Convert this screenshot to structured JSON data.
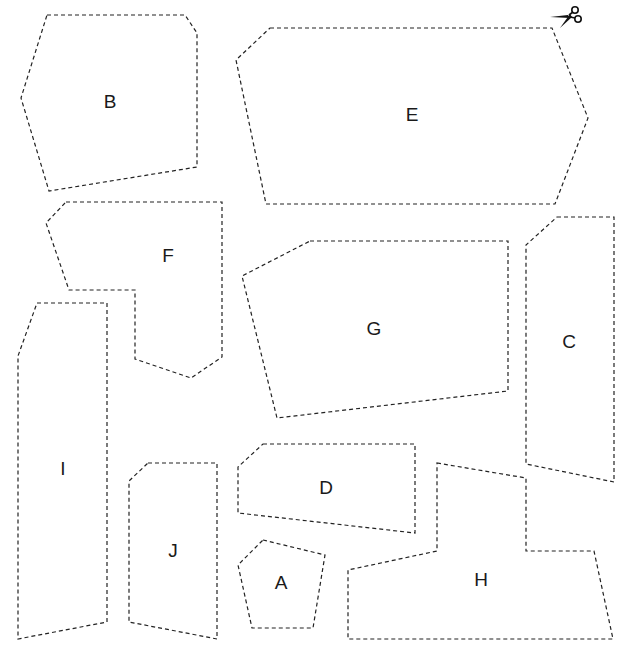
{
  "page": {
    "width": 629,
    "height": 657,
    "line_color": "#222222",
    "background": "#ffffff"
  },
  "scissors": {
    "icon": "scissors-icon",
    "position": [
      565,
      18
    ]
  },
  "pieces": [
    {
      "id": "A",
      "label": "A",
      "label_pos": [
        281,
        584
      ],
      "points": [
        [
          263,
          540
        ],
        [
          325,
          555
        ],
        [
          313,
          628
        ],
        [
          252,
          628
        ],
        [
          238,
          565
        ]
      ]
    },
    {
      "id": "B",
      "label": "B",
      "label_pos": [
        110,
        103
      ],
      "points": [
        [
          47,
          15
        ],
        [
          185,
          15
        ],
        [
          197,
          33
        ],
        [
          197,
          167
        ],
        [
          49,
          191
        ],
        [
          21,
          98
        ]
      ]
    },
    {
      "id": "C",
      "label": "C",
      "label_pos": [
        569,
        343
      ],
      "points": [
        [
          557,
          217
        ],
        [
          614,
          217
        ],
        [
          614,
          482
        ],
        [
          526,
          464
        ],
        [
          526,
          245
        ]
      ]
    },
    {
      "id": "D",
      "label": "D",
      "label_pos": [
        326,
        489
      ],
      "points": [
        [
          263,
          444
        ],
        [
          415,
          444
        ],
        [
          415,
          533
        ],
        [
          238,
          513
        ],
        [
          238,
          467
        ]
      ]
    },
    {
      "id": "E",
      "label": "E",
      "label_pos": [
        412,
        116
      ],
      "points": [
        [
          270,
          28
        ],
        [
          552,
          28
        ],
        [
          588,
          118
        ],
        [
          555,
          204
        ],
        [
          266,
          204
        ],
        [
          236,
          60
        ]
      ]
    },
    {
      "id": "F",
      "label": "F",
      "label_pos": [
        168,
        257
      ],
      "points": [
        [
          66,
          202
        ],
        [
          222,
          202
        ],
        [
          222,
          357
        ],
        [
          191,
          378
        ],
        [
          135,
          359
        ],
        [
          135,
          290
        ],
        [
          69,
          290
        ],
        [
          46,
          223
        ]
      ]
    },
    {
      "id": "G",
      "label": "G",
      "label_pos": [
        374,
        330
      ],
      "points": [
        [
          310,
          241
        ],
        [
          508,
          241
        ],
        [
          508,
          391
        ],
        [
          277,
          418
        ],
        [
          242,
          276
        ]
      ]
    },
    {
      "id": "H",
      "label": "H",
      "label_pos": [
        481,
        581
      ],
      "points": [
        [
          437,
          463
        ],
        [
          526,
          478
        ],
        [
          526,
          551
        ],
        [
          594,
          551
        ],
        [
          613,
          639
        ],
        [
          348,
          639
        ],
        [
          348,
          570
        ],
        [
          437,
          551
        ]
      ]
    },
    {
      "id": "I",
      "label": "I",
      "label_pos": [
        63,
        470
      ],
      "points": [
        [
          37,
          303
        ],
        [
          107,
          303
        ],
        [
          107,
          622
        ],
        [
          18,
          639
        ],
        [
          18,
          356
        ]
      ]
    },
    {
      "id": "J",
      "label": "J",
      "label_pos": [
        173,
        552
      ],
      "points": [
        [
          148,
          463
        ],
        [
          217,
          463
        ],
        [
          217,
          639
        ],
        [
          129,
          622
        ],
        [
          129,
          481
        ]
      ]
    }
  ]
}
